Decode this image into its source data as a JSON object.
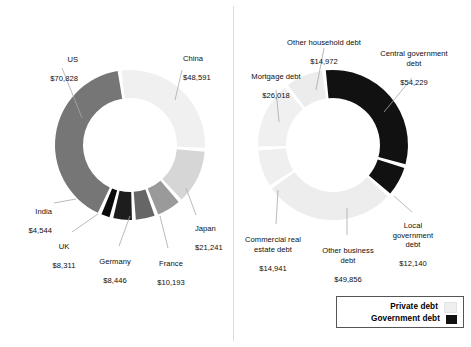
{
  "legend": {
    "items": [
      {
        "label": "Private debt",
        "color": "#efefef"
      },
      {
        "label": "Government debt",
        "color": "#111111"
      }
    ]
  },
  "chart_data": [
    {
      "type": "pie",
      "variant": "donut",
      "id": "debt-by-country",
      "title": "",
      "unit": "USD billions",
      "value_prefix": "$",
      "start_angle_deg": -8,
      "gap_deg": 3,
      "categories": [
        "China",
        "Japan",
        "France",
        "Germany",
        "UK",
        "India",
        "US"
      ],
      "values": [
        48591,
        21241,
        10193,
        8446,
        8311,
        4544,
        70828
      ],
      "value_labels": [
        "$48,591",
        "$21,241",
        "$10,193",
        "$8,446",
        "$8,311",
        "$4,544",
        "$70,828"
      ],
      "colors": [
        "#f0f0f0",
        "#d6d6d6",
        "#9a9a9a",
        "#666666",
        "#1d1d1d",
        "#0a0a0a",
        "#767676"
      ],
      "legend_position": "none"
    },
    {
      "type": "pie",
      "variant": "donut",
      "id": "debt-by-type",
      "title": "",
      "unit": "USD billions",
      "value_prefix": "$",
      "start_angle_deg": -7,
      "gap_deg": 3,
      "categories": [
        "Central government debt",
        "Local government debt",
        "Other business debt",
        "Commercial real estate debt",
        "Mortgage debt",
        "Other household debt"
      ],
      "values": [
        54229,
        12140,
        49856,
        14941,
        26018,
        14972
      ],
      "value_labels": [
        "$54,229",
        "$12,140",
        "$49,856",
        "$14,941",
        "$26,018",
        "$14,972"
      ],
      "colors": [
        "#111111",
        "#111111",
        "#ededed",
        "#efefef",
        "#f0f0f0",
        "#ececec"
      ],
      "legend_position": "bottom-right"
    }
  ],
  "left_chart": {
    "labels": [
      {
        "name": "US",
        "value": "$70,828"
      },
      {
        "name": "China",
        "value": "$48,591"
      },
      {
        "name": "Japan",
        "value": "$21,241"
      },
      {
        "name": "France",
        "value": "$10,193"
      },
      {
        "name": "Germany",
        "value": "$8,446"
      },
      {
        "name": "UK",
        "value": "$8,311"
      },
      {
        "name": "India",
        "value": "$4,544"
      }
    ]
  },
  "right_chart": {
    "labels": [
      {
        "name": "Central government\ndebt",
        "value": "$54,229"
      },
      {
        "name": "Local\ngovernment\ndebt",
        "value": "$12,140"
      },
      {
        "name": "Other business\ndebt",
        "value": "$49,856"
      },
      {
        "name": "Commercial real\nestate debt",
        "value": "$14,941"
      },
      {
        "name": "Mortgage debt",
        "value": "$26,018"
      },
      {
        "name": "Other household debt",
        "value": "$14,972"
      }
    ]
  }
}
